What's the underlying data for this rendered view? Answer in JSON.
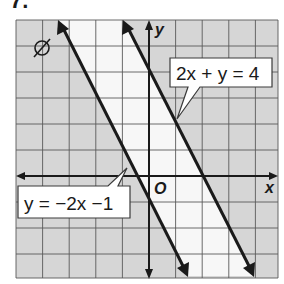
{
  "problem_number": "7.",
  "empty_set_symbol": "∅",
  "graph": {
    "x_range": [
      -5,
      5
    ],
    "y_range": [
      -4,
      6
    ],
    "axis_labels": {
      "x": "x",
      "y": "y",
      "origin": "O"
    },
    "colors": {
      "shaded": "#d6d6d6",
      "unshaded": "#f7f7f7",
      "grid_line": "#5a5a5a",
      "ink": "#1a1a1a"
    }
  },
  "lines": [
    {
      "equation": "2x + y = 4",
      "slope": -2,
      "intercept": 4
    },
    {
      "equation": "y = −2x −1",
      "slope": -2,
      "intercept": -1
    }
  ],
  "callouts": {
    "upper": "2x + y = 4",
    "lower": "y = −2x −1"
  }
}
